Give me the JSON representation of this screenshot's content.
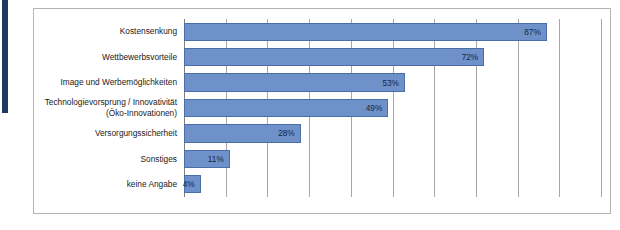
{
  "chart_data": {
    "type": "bar",
    "orientation": "horizontal",
    "title": "",
    "subtitle": "",
    "xlabel": "",
    "ylabel": "",
    "xlim": [
      0,
      100
    ],
    "xtick_labels": [],
    "grid": true,
    "grid_axis": "x",
    "grid_interval": 10,
    "legend": false,
    "legend_position": "none",
    "value_label_suffix": "%",
    "categories": [
      "Kostensenkung",
      "Wettbewerbsvorteile",
      "Image und Werbemöglichkeiten",
      "Technologievorsprung / Innovativität\n(Öko-Innovationen)",
      "Versorgungssicherheit",
      "Sonstiges",
      "keine Angabe"
    ],
    "values": [
      87,
      72,
      53,
      49,
      28,
      11,
      4
    ],
    "value_labels": [
      "87%",
      "72%",
      "53%",
      "49%",
      "28%",
      "11%",
      "4%"
    ]
  },
  "colors": {
    "bar_fill": "#6f91c9",
    "bar_border": "#4a6ea8",
    "accent_bar": "#1f3864",
    "frame_border": "#b4b4b4",
    "gridline": "#a6a6a6",
    "label_text": "#1a1a1a",
    "value_text": "#15253f",
    "background": "#ffffff"
  }
}
